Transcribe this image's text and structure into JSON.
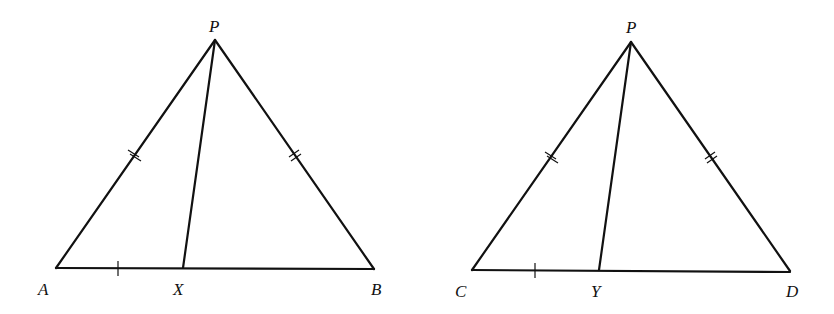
{
  "figures": [
    {
      "name": "triangle-PAB",
      "labels": {
        "apex": "P",
        "left": "A",
        "foot": "X",
        "right": "B"
      },
      "points": {
        "apex": [
          215,
          40
        ],
        "left": [
          56,
          268
        ],
        "foot": [
          183,
          268
        ],
        "right": [
          374,
          269
        ]
      }
    },
    {
      "name": "triangle-PCD",
      "labels": {
        "apex": "P",
        "left": "C",
        "foot": "Y",
        "right": "D"
      },
      "points": {
        "apex": [
          631,
          42
        ],
        "left": [
          472,
          270
        ],
        "foot": [
          599,
          270
        ],
        "right": [
          790,
          271
        ]
      }
    }
  ],
  "marks": {
    "single_tick": "left segment of base equals",
    "double_tick": "two sides from apex are equal"
  },
  "colors": {
    "line": "#111111",
    "background": "#ffffff"
  }
}
